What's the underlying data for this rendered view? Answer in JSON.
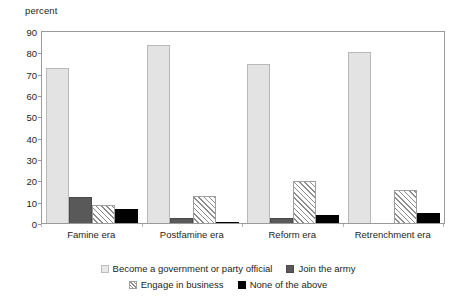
{
  "chart_data": {
    "type": "bar",
    "title": "",
    "subtitle": "",
    "xlabel": "",
    "ylabel": "percent",
    "ylim": [
      0,
      90
    ],
    "ytick_step": 10,
    "yticks": [
      90,
      80,
      70,
      60,
      50,
      40,
      30,
      20,
      10,
      0
    ],
    "grid": false,
    "legend_position": "bottom",
    "categories": [
      "Famine era",
      "Postfamine era",
      "Reform era",
      "Retrenchment era"
    ],
    "series": [
      {
        "name": "Become a government or party official",
        "color": "#e3e3e3",
        "pattern": "solid-light",
        "values": [
          73,
          84,
          75,
          80.5
        ]
      },
      {
        "name": "Join the army",
        "color": "#595959",
        "pattern": "solid-dark",
        "values": [
          12.5,
          3,
          3,
          0
        ]
      },
      {
        "name": "Engage in business",
        "color": "#8c8c8c",
        "pattern": "diagonal-hatch",
        "values": [
          9,
          13,
          20,
          16
        ]
      },
      {
        "name": "None of the above",
        "color": "#000000",
        "pattern": "solid-black",
        "values": [
          7,
          1,
          4,
          5
        ]
      }
    ]
  },
  "legend": {
    "rows": [
      [
        "Become a government or party official",
        "Join the army"
      ],
      [
        "Engage in business",
        "None of the above"
      ]
    ]
  }
}
